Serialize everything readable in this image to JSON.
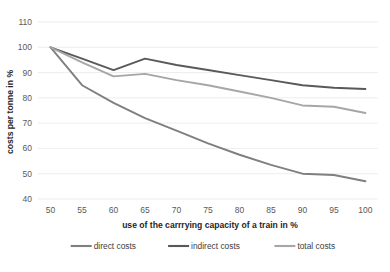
{
  "chart_data": {
    "type": "line",
    "title": "",
    "xlabel": "use of the carrrying capacity of a train in %",
    "ylabel": "costs per tonne in %",
    "x": [
      50,
      55,
      60,
      65,
      70,
      75,
      80,
      85,
      90,
      95,
      100
    ],
    "xlim": [
      48,
      102
    ],
    "ylim": [
      40,
      110
    ],
    "xticks": [
      "50",
      "55",
      "60",
      "65",
      "70",
      "75",
      "80",
      "85",
      "90",
      "95",
      "100"
    ],
    "yticks": [
      "40",
      "50",
      "60",
      "70",
      "80",
      "90",
      "100",
      "110"
    ],
    "grid": true,
    "legend_position": "bottom",
    "series": [
      {
        "name": "direct costs",
        "color": "#7f7f7f",
        "values": [
          100,
          85,
          78,
          72,
          67,
          62,
          57.5,
          53.5,
          50,
          49.5,
          47
        ]
      },
      {
        "name": "indirect costs",
        "color": "#595959",
        "values": [
          100,
          95.5,
          91,
          95.5,
          93,
          91,
          89,
          87,
          85,
          84,
          83.5
        ]
      },
      {
        "name": "total costs",
        "color": "#a6a6a6",
        "values": [
          100,
          94,
          88.5,
          89.5,
          87,
          85,
          82.5,
          80,
          77,
          76.5,
          74
        ]
      }
    ]
  },
  "legend": {
    "items": [
      {
        "label": "direct costs",
        "color": "#7f7f7f"
      },
      {
        "label": "indirect costs",
        "color": "#595959"
      },
      {
        "label": "total costs",
        "color": "#a6a6a6"
      }
    ]
  }
}
